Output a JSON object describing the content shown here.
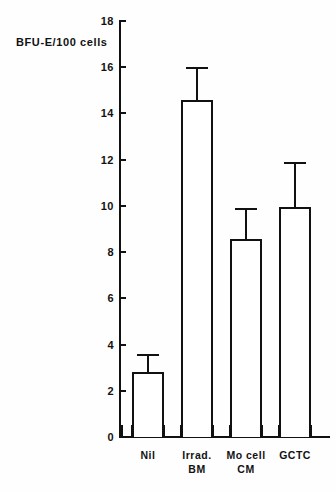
{
  "chart_data": {
    "type": "bar",
    "title": "",
    "subtitle": "",
    "xlabel": "",
    "ylabel": "BFU-E/100 cells",
    "ylim": [
      0,
      18
    ],
    "yticks": [
      0,
      2,
      4,
      6,
      8,
      10,
      12,
      14,
      16,
      18
    ],
    "ytick_labels": [
      "0",
      "2",
      "4",
      "6",
      "8",
      "10",
      "12",
      "14",
      "16",
      "18"
    ],
    "grid": false,
    "legend": null,
    "categories": [
      "Nil",
      "Irrad. BM",
      "Mo cell CM",
      "GCTC"
    ],
    "category_lines": [
      {
        "line1": "Nil",
        "line2": ""
      },
      {
        "line1": "Irrad.",
        "line2": "BM"
      },
      {
        "line1": "Mo cell",
        "line2": "CM"
      },
      {
        "line1": "GCTC",
        "line2": ""
      }
    ],
    "values": [
      2.8,
      14.6,
      8.55,
      9.95
    ],
    "error_high": [
      3.6,
      16.0,
      9.9,
      11.9
    ],
    "error_bars": [
      {
        "category": "Nil",
        "value": 2.8,
        "upper": 3.6,
        "error": 0.8
      },
      {
        "category": "Irrad. BM",
        "value": 14.6,
        "upper": 16.0,
        "error": 1.4
      },
      {
        "category": "Mo cell CM",
        "value": 8.55,
        "upper": 9.9,
        "error": 1.35
      },
      {
        "category": "GCTC",
        "value": 9.95,
        "upper": 11.9,
        "error": 1.95
      }
    ],
    "colors": {
      "bar_fill": "#ffffff",
      "bar_edge": "#111111",
      "axis": "#111111",
      "text": "#121212",
      "background": "#fefefe"
    }
  }
}
